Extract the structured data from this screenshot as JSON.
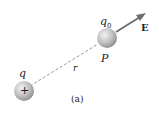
{
  "diagram": {
    "source_charge": {
      "label": "q",
      "sign": "+"
    },
    "test_charge": {
      "label": "q",
      "subscript": "0",
      "point_label": "P"
    },
    "field_vector": {
      "label": "E"
    },
    "distance": {
      "label": "r"
    },
    "caption": "(a)",
    "colors": {
      "sphere": "#b0b0b0",
      "arrow": "#707070",
      "dash": "#999999"
    }
  }
}
